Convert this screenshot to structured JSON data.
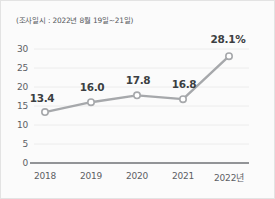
{
  "card": {
    "background_color": "#fbfbfb",
    "border_color": "#e3e3e3"
  },
  "note": {
    "text": "(조사일시 : 2022년 8월 19일~21일)"
  },
  "chart_data": {
    "type": "line",
    "title": "",
    "subtitle": "(조사일시 : 2022년 8월 19일~21일)",
    "xlabel": "",
    "ylabel": "",
    "categories": [
      "2018",
      "2019",
      "2020",
      "2021",
      "2022년"
    ],
    "values": [
      13.4,
      16.0,
      17.8,
      16.8,
      28.1
    ],
    "point_labels": [
      "13.4",
      "16.0",
      "17.8",
      "16.8",
      "28.1%"
    ],
    "ylim": [
      0,
      32
    ],
    "y_ticks": [
      "0",
      "5",
      "10",
      "15",
      "20",
      "25",
      "30"
    ],
    "y_tick_values": [
      0,
      5,
      10,
      15,
      20,
      25,
      30
    ],
    "grid": true,
    "legend": "none",
    "series": [
      {
        "name": "비율",
        "values": [
          13.4,
          16.0,
          17.8,
          16.8,
          28.1
        ],
        "line_color": "#a6a8ab",
        "marker_fill": "#ffffff",
        "marker_stroke": "#a6a8ab"
      }
    ],
    "axis_color": "#6f7276",
    "grid_color": "#ececec",
    "label_color": "#5d6064",
    "value_label_color": "#3c3f42"
  }
}
